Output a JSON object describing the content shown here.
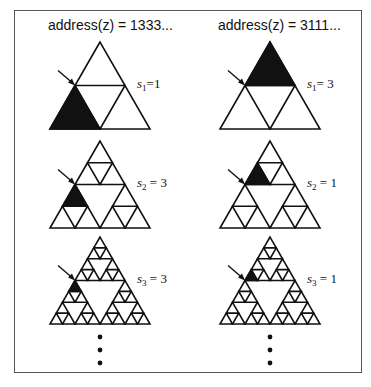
{
  "columns": [
    {
      "title": "address(z) = 1333...",
      "address": [
        1,
        3,
        3,
        3
      ],
      "apex_x": 100,
      "rows": [
        {
          "level": 1,
          "label_var": "s",
          "label_sub": "1",
          "label_eq": "=1",
          "value": 1
        },
        {
          "level": 2,
          "label_var": "s",
          "label_sub": "2",
          "label_eq": " = 3",
          "value": 3
        },
        {
          "level": 3,
          "label_var": "s",
          "label_sub": "3",
          "label_eq": " = 3",
          "value": 3
        }
      ]
    },
    {
      "title": "address(z) = 3111...",
      "address": [
        3,
        1,
        1,
        1
      ],
      "apex_x": 270,
      "rows": [
        {
          "level": 1,
          "label_var": "s",
          "label_sub": "1",
          "label_eq": "= 3",
          "value": 3
        },
        {
          "level": 2,
          "label_var": "s",
          "label_sub": "2",
          "label_eq": " = 1",
          "value": 1
        },
        {
          "level": 3,
          "label_var": "s",
          "label_sub": "3",
          "label_eq": " = 1",
          "value": 1
        }
      ]
    }
  ],
  "row_apex_y": [
    42,
    141,
    237
  ],
  "triangle": {
    "width": 100,
    "height": 87
  },
  "continuation": "vertical ellipsis",
  "colors": {
    "stroke": "#111111",
    "fill": "#111111",
    "border": "#555555"
  }
}
